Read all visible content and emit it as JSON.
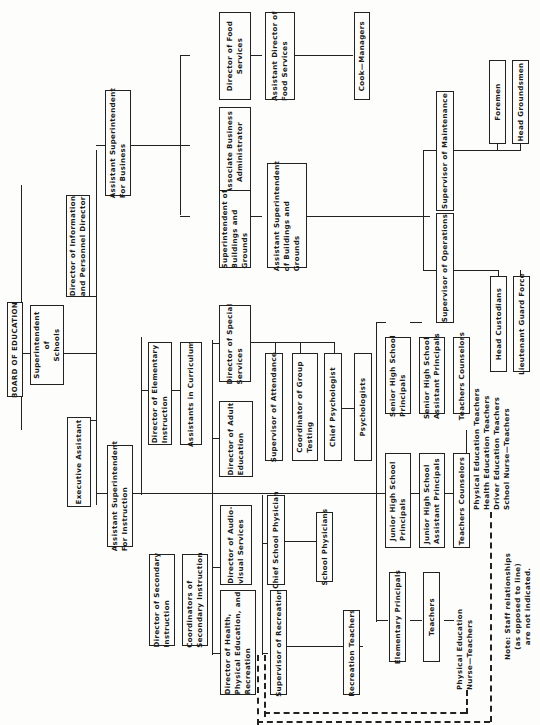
{
  "title": "BOARD OF EDUCATION",
  "nodes": {
    "board": "BOARD OF EDUCATION",
    "superintendent": "Superintendent\nof\nSchools",
    "dir_info": "Director of Information\nand Personnel Director",
    "exec_asst": "Executive Assistant",
    "asst_sup_business": "Assistant Superintendent\nFor Business",
    "asst_sup_instruction": "Assistant Superintendent\nFor Instruction",
    "dir_food": "Director of Food\nServices",
    "asst_dir_food": "Assistant Director of\nFood Services",
    "cook_managers": "Cook—Managers",
    "assoc_business": "Associate Business\nAdministrator",
    "sup_buildings": "Superintendent of\nBuildings and\nGrounds",
    "asst_sup_buildings": "Assistant Superintendent\nof Buildings and\nGrounds",
    "sup_maintenance": "Supervisor of Maintenance",
    "foremen": "Foremen",
    "head_groundsmen": "Head Groundsmen",
    "sup_operations": "Supervisor of Operations",
    "head_custodians": "Head Custodians",
    "lt_guard": "Lieutenant Guard Force",
    "dir_elementary": "Director of Elementary\nInstruction",
    "asst_curriculum": "Assistants in Curriculum",
    "dir_special": "Director of Special\nServices",
    "dir_adult": "Director of Adult\nEducation",
    "sup_attendance": "Supervisor of Attendance",
    "coord_testing": "Coordinator of Group\nTesting",
    "chief_psych": "Chief Psychologist",
    "psychologists": "Psychologists",
    "sr_principals": "Senior High School\nPrincipals",
    "sr_asst_principals": "Senior High School\nAssistant Principals",
    "sr_teachers_counselors": "Teachers Counselors",
    "jr_principals": "Junior High School\nPrincipals",
    "jr_asst_principals": "Junior High School\nAssistant Principals",
    "jr_teachers_counselors": "Teachers Counselors",
    "dir_secondary": "Director of Secondary\nInstruction",
    "coord_secondary": "Coordinators of\nSecondary Instruction",
    "dir_audio": "Director of Audio-\nvisual Services",
    "dir_health": "Director of Health,\nPhysical Education, and\nRecreation",
    "chief_physician": "Chief School Physician",
    "school_physicians": "School Physicians",
    "sup_recreation": "Supervisor of Recreation",
    "recreation_teachers": "Recreation Teachers",
    "elem_principals": "Elementary Principals",
    "elem_teachers": "Teachers"
  },
  "labels": {
    "secondary_teachers": "Physical Education Teachers\nHealth Education Teachers\nDriver Education Teachers\nSchool Nurse—Teachers",
    "elementary_teachers": "Physical Education\nNurse—Teachers",
    "note": "Note: Staff relationships\n(as opposed to line)\nare not indicated."
  }
}
